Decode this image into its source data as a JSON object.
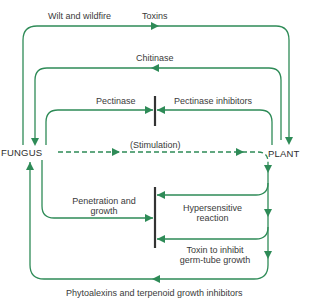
{
  "diagram": {
    "nodes": {
      "fungus": "FUNGUS",
      "plant": "PLANT"
    },
    "edges": {
      "wilt": "Wilt and wildfire",
      "toxins": "Toxins",
      "chitinase": "Chitinase",
      "pectinase": "Pectinase",
      "pectinase_inhibitors": "Pectinase inhibitors",
      "stimulation": "(Stimulation)",
      "penetration_line1": "Penetration and",
      "penetration_line2": "growth",
      "hypersensitive_line1": "Hypersensitive",
      "hypersensitive_line2": "reaction",
      "toxin_inhibit_line1": "Toxin to inhibit",
      "toxin_inhibit_line2": "germ-tube growth",
      "phytoalexins": "Phytoalexins and terpenoid growth inhibitors"
    },
    "colors": {
      "arrow": "#2e8b57",
      "barrier": "#333333",
      "text": "#3a3a3a"
    }
  }
}
